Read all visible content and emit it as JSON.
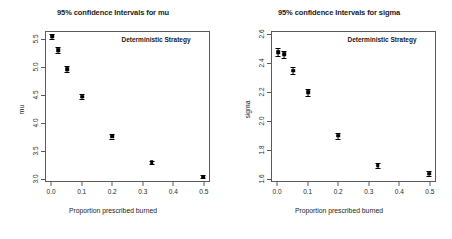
{
  "chart_data": [
    {
      "type": "scatter",
      "title": "95% confidence Intervals for mu",
      "annotation": "Deterministic Strategy",
      "xlabel": "Proportion prescribed burned",
      "ylabel": "mu",
      "xlim": [
        -0.02,
        0.52
      ],
      "ylim": [
        2.95,
        5.65
      ],
      "xticks": [
        0.0,
        0.1,
        0.2,
        0.3,
        0.4,
        0.5
      ],
      "xtick_labels": [
        "0.0",
        "0.1",
        "0.2",
        "0.3",
        "0.4",
        "0.5"
      ],
      "yticks": [
        3.0,
        3.5,
        4.0,
        4.5,
        5.0,
        5.5
      ],
      "ytick_labels": [
        "3.0",
        "3.5",
        "4.0",
        "4.5",
        "5.0",
        "5.5"
      ],
      "grid": false,
      "legend": "none",
      "x": [
        0.0,
        0.02,
        0.05,
        0.1,
        0.2,
        0.33,
        0.5
      ],
      "values": [
        5.57,
        5.32,
        4.98,
        4.48,
        3.76,
        3.29,
        3.03
      ],
      "ci_lower": [
        5.52,
        5.27,
        4.93,
        4.44,
        3.72,
        3.26,
        3.0
      ],
      "ci_upper": [
        5.62,
        5.37,
        5.03,
        4.52,
        3.8,
        3.32,
        3.06
      ]
    },
    {
      "type": "scatter",
      "title": "95% confidence Intervals for sigma",
      "annotation": "Deterministic Strategy",
      "xlabel": "Proportion prescribed burned",
      "ylabel": "sigma",
      "xlim": [
        -0.02,
        0.52
      ],
      "ylim": [
        1.58,
        2.62
      ],
      "xticks": [
        0.0,
        0.1,
        0.2,
        0.3,
        0.4,
        0.5
      ],
      "xtick_labels": [
        "0.0",
        "0.1",
        "0.2",
        "0.3",
        "0.4",
        "0.5"
      ],
      "yticks": [
        1.6,
        1.8,
        2.0,
        2.2,
        2.4,
        2.6
      ],
      "ytick_labels": [
        "1.6",
        "1.8",
        "2.0",
        "2.2",
        "2.4",
        "2.6"
      ],
      "grid": false,
      "legend": "none",
      "x": [
        0.0,
        0.02,
        0.05,
        0.1,
        0.2,
        0.33,
        0.5
      ],
      "values": [
        2.48,
        2.465,
        2.35,
        2.2,
        1.895,
        1.69,
        1.63
      ],
      "ci_lower": [
        2.455,
        2.44,
        2.325,
        2.175,
        1.875,
        1.672,
        1.612
      ],
      "ci_upper": [
        2.505,
        2.49,
        2.375,
        2.225,
        1.915,
        1.708,
        1.648
      ]
    }
  ]
}
